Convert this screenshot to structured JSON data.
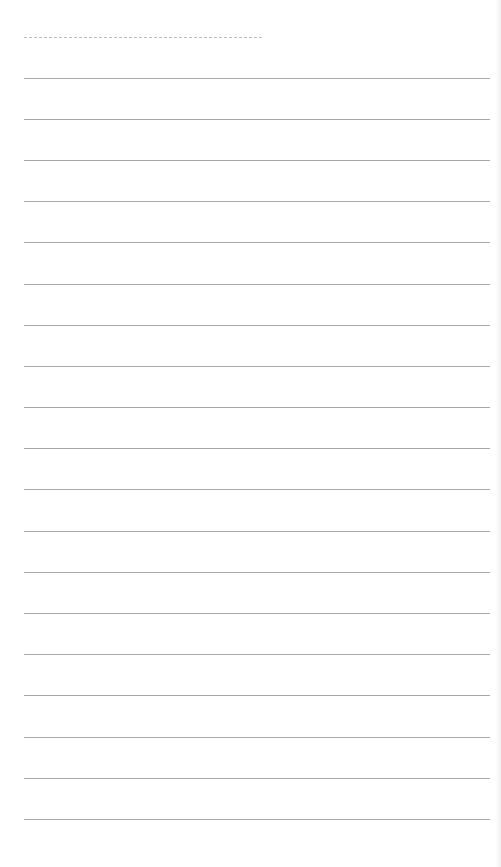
{
  "page": {
    "type": "blank-lined-notebook-page",
    "background_color": "#ffffff",
    "line_color": "#a8a8a8",
    "dashed_line_color": "#bdbdbd"
  },
  "header_line": {
    "style": "dashed",
    "x_start": 24,
    "x_end": 262,
    "y": 37
  },
  "ruled_lines": {
    "count": 19,
    "x_start": 24,
    "x_end": 490,
    "first_y": 78,
    "spacing": 41.15,
    "y_positions": [
      78,
      119,
      160,
      201,
      242,
      284,
      325,
      366,
      407,
      448,
      489,
      531,
      572,
      613,
      654,
      695,
      737,
      778,
      819
    ]
  }
}
